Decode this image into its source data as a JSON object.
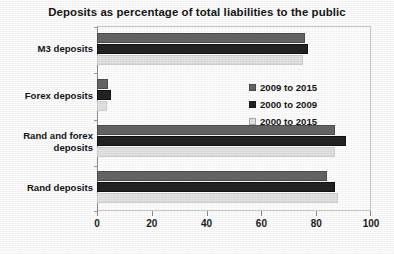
{
  "chart_data": {
    "type": "bar",
    "orientation": "horizontal",
    "title": "Deposits as percentage of total liabilities to the public",
    "xlabel": "",
    "ylabel": "",
    "xlim": [
      0,
      100
    ],
    "xticks": [
      0,
      20,
      40,
      60,
      80,
      100
    ],
    "xtick_labels": [
      "0",
      "20",
      "40",
      "60",
      "80",
      "100"
    ],
    "grid": false,
    "legend_position": "inside-right",
    "categories": [
      "M3 deposits",
      "Forex deposits",
      "Rand and forex deposits",
      "Rand deposits"
    ],
    "series": [
      {
        "name": "2009 to 2015",
        "color": "#656565",
        "values": [
          76,
          4,
          87,
          84
        ]
      },
      {
        "name": "2000 to 2009",
        "color": "#232323",
        "values": [
          77,
          5,
          91,
          87
        ]
      },
      {
        "name": "2000 to 2015",
        "color": "#e2e2e2",
        "values": [
          75,
          3.5,
          87,
          88
        ]
      }
    ]
  }
}
